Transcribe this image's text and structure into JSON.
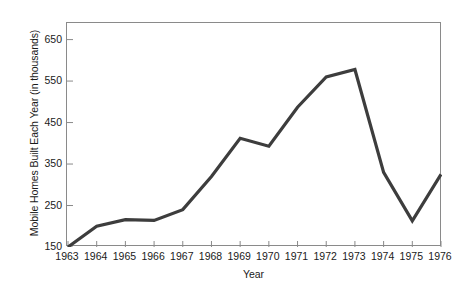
{
  "chart_data": {
    "type": "line",
    "title": "",
    "xlabel": "Year",
    "ylabel": "Mobile Homes Built Each Year (in thousands)",
    "categories": [
      "1963",
      "1964",
      "1965",
      "1966",
      "1967",
      "1968",
      "1969",
      "1970",
      "1971",
      "1972",
      "1973",
      "1974",
      "1975",
      "1976"
    ],
    "values": [
      150,
      200,
      216,
      214,
      240,
      320,
      412,
      393,
      487,
      560,
      578,
      330,
      213,
      325
    ],
    "series": [
      {
        "name": "Mobile Homes Built Each Year",
        "values": [
          150,
          200,
          216,
          214,
          240,
          320,
          412,
          393,
          487,
          560,
          578,
          330,
          213,
          325
        ]
      }
    ],
    "x": [
      "1963",
      "1964",
      "1965",
      "1966",
      "1967",
      "1968",
      "1969",
      "1970",
      "1971",
      "1972",
      "1973",
      "1974",
      "1975",
      "1976"
    ],
    "ylim": [
      150,
      690
    ],
    "xlim": [
      "1963",
      "1976"
    ],
    "yticks": [
      "150",
      "250",
      "350",
      "450",
      "550",
      "650"
    ],
    "ytick_values": [
      150,
      250,
      350,
      450,
      550,
      650
    ],
    "xticks": [
      "1963",
      "1964",
      "1965",
      "1966",
      "1967",
      "1968",
      "1969",
      "1970",
      "1971",
      "1972",
      "1973",
      "1974",
      "1975",
      "1976"
    ],
    "grid": false,
    "legend": false,
    "legend_position": "none",
    "line_color": "#3d3d3d",
    "line_width": 3.2,
    "frame_color": "#8a8a8a",
    "background": "#ffffff"
  },
  "axes": {
    "y_title": "Mobile Homes Built Each Year (in thousands)",
    "x_title": "Year"
  }
}
